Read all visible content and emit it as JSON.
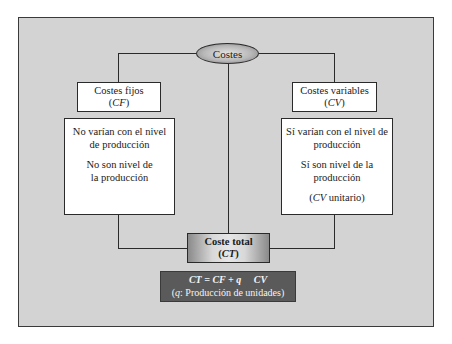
{
  "diagram": {
    "root": {
      "label": "Costes"
    },
    "fixed_costs": {
      "title": "Costes fijos",
      "abbr_open": "(",
      "abbr": "CF",
      "abbr_close": ")",
      "description": [
        "No varían con el nivel de producción",
        "No son nivel de la producción"
      ]
    },
    "variable_costs": {
      "title": "Costes variables",
      "abbr_open": "(",
      "abbr": "CV",
      "abbr_close": ")",
      "description": [
        "Sí varían con el nivel de producción",
        "Sí son nivel de la producción"
      ],
      "note_open": "(",
      "note_abbr": "CV",
      "note_text": " unitario)"
    },
    "total_cost": {
      "title": "Coste total",
      "abbr_open": "(",
      "abbr": "CT",
      "abbr_close": ")"
    },
    "formula": {
      "equation": "CT = CF + q     CV",
      "legend_open": "(",
      "legend_var": "q",
      "legend_text": ": Producción de unidades)"
    }
  },
  "colors": {
    "background": "#d3d3d3",
    "lines": "#2a2a2a",
    "formula_box": "#5a5a5a"
  }
}
